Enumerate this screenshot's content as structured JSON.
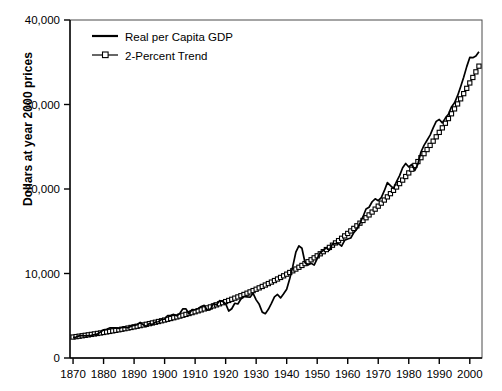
{
  "chart_data": {
    "type": "line",
    "title": "",
    "xlabel": "",
    "ylabel": "Dollars at year 2000 prices",
    "xlim": [
      1869,
      2004
    ],
    "ylim": [
      0,
      40000
    ],
    "grid": false,
    "legend_position": "top-left-inside",
    "xticks": [
      1870,
      1880,
      1890,
      1900,
      1910,
      1920,
      1930,
      1940,
      1950,
      1960,
      1970,
      1980,
      1990,
      2000
    ],
    "xtick_labels": [
      "1870",
      "1880",
      "1890",
      "1900",
      "1910",
      "1920",
      "1930",
      "1940",
      "1950",
      "1960",
      "1970",
      "1980",
      "1990",
      "2000"
    ],
    "yticks": [
      0,
      10000,
      20000,
      30000,
      40000
    ],
    "ytick_labels": [
      "0",
      "10,000",
      "20,000",
      "30,000",
      "40,000"
    ],
    "series": [
      {
        "name": "Real per Capita GDP",
        "marker": "none",
        "color": "#000000",
        "x": [
          1870,
          1871,
          1872,
          1873,
          1874,
          1875,
          1876,
          1877,
          1878,
          1879,
          1880,
          1881,
          1882,
          1883,
          1884,
          1885,
          1886,
          1887,
          1888,
          1889,
          1890,
          1891,
          1892,
          1893,
          1894,
          1895,
          1896,
          1897,
          1898,
          1899,
          1900,
          1901,
          1902,
          1903,
          1904,
          1905,
          1906,
          1907,
          1908,
          1909,
          1910,
          1911,
          1912,
          1913,
          1914,
          1915,
          1916,
          1917,
          1918,
          1919,
          1920,
          1921,
          1922,
          1923,
          1924,
          1925,
          1926,
          1927,
          1928,
          1929,
          1930,
          1931,
          1932,
          1933,
          1934,
          1935,
          1936,
          1937,
          1938,
          1939,
          1940,
          1941,
          1942,
          1943,
          1944,
          1945,
          1946,
          1947,
          1948,
          1949,
          1950,
          1951,
          1952,
          1953,
          1954,
          1955,
          1956,
          1957,
          1958,
          1959,
          1960,
          1961,
          1962,
          1963,
          1964,
          1965,
          1966,
          1967,
          1968,
          1969,
          1970,
          1971,
          1972,
          1973,
          1974,
          1975,
          1976,
          1977,
          1978,
          1979,
          1980,
          1981,
          1982,
          1983,
          1984,
          1985,
          1986,
          1987,
          1988,
          1989,
          1990,
          1991,
          1992,
          1993,
          1994,
          1995,
          1996,
          1997,
          1998,
          1999,
          2000,
          2001,
          2002,
          2003
        ],
        "values": [
          2445,
          2480,
          2620,
          2660,
          2610,
          2650,
          2680,
          2760,
          2830,
          3080,
          3340,
          3390,
          3560,
          3580,
          3560,
          3490,
          3610,
          3640,
          3570,
          3760,
          3870,
          3940,
          4220,
          3930,
          3720,
          4090,
          3950,
          4260,
          4290,
          4580,
          4610,
          5030,
          5050,
          5160,
          4990,
          5290,
          5830,
          5820,
          5210,
          5730,
          5700,
          5850,
          6090,
          6230,
          5650,
          5710,
          6450,
          6280,
          6790,
          6690,
          6430,
          5560,
          5830,
          6480,
          6390,
          6980,
          7280,
          7240,
          7190,
          7660,
          6880,
          6350,
          5430,
          5250,
          5760,
          6470,
          7230,
          7520,
          7110,
          7600,
          8140,
          9380,
          10840,
          12520,
          13270,
          12990,
          11300,
          11000,
          11200,
          10990,
          11750,
          12460,
          12740,
          13070,
          12770,
          13520,
          13550,
          13530,
          13240,
          13930,
          14090,
          14200,
          14840,
          15270,
          15920,
          16720,
          17630,
          17840,
          18490,
          18840,
          18620,
          18970,
          19800,
          20750,
          20390,
          20070,
          20880,
          21580,
          22520,
          23020,
          22610,
          22920,
          22200,
          22950,
          24380,
          25160,
          25770,
          26380,
          27230,
          28000,
          28230,
          27820,
          28390,
          28850,
          29710,
          30200,
          31040,
          32100,
          33220,
          34480,
          35570,
          35540,
          35740,
          36250
        ]
      },
      {
        "name": "2-Percent Trend",
        "marker": "square-open",
        "color": "#000000",
        "x": [
          1870,
          1871,
          1872,
          1873,
          1874,
          1875,
          1876,
          1877,
          1878,
          1879,
          1880,
          1881,
          1882,
          1883,
          1884,
          1885,
          1886,
          1887,
          1888,
          1889,
          1890,
          1891,
          1892,
          1893,
          1894,
          1895,
          1896,
          1897,
          1898,
          1899,
          1900,
          1901,
          1902,
          1903,
          1904,
          1905,
          1906,
          1907,
          1908,
          1909,
          1910,
          1911,
          1912,
          1913,
          1914,
          1915,
          1916,
          1917,
          1918,
          1919,
          1920,
          1921,
          1922,
          1923,
          1924,
          1925,
          1926,
          1927,
          1928,
          1929,
          1930,
          1931,
          1932,
          1933,
          1934,
          1935,
          1936,
          1937,
          1938,
          1939,
          1940,
          1941,
          1942,
          1943,
          1944,
          1945,
          1946,
          1947,
          1948,
          1949,
          1950,
          1951,
          1952,
          1953,
          1954,
          1955,
          1956,
          1957,
          1958,
          1959,
          1960,
          1961,
          1962,
          1963,
          1964,
          1965,
          1966,
          1967,
          1968,
          1969,
          1970,
          1971,
          1972,
          1973,
          1974,
          1975,
          1976,
          1977,
          1978,
          1979,
          1980,
          1981,
          1982,
          1983,
          1984,
          1985,
          1986,
          1987,
          1988,
          1989,
          1990,
          1991,
          1992,
          1993,
          1994,
          1995,
          1996,
          1997,
          1998,
          1999,
          2000,
          2001,
          2002,
          2003
        ],
        "values": [
          2480,
          2530,
          2580,
          2632,
          2685,
          2738,
          2793,
          2849,
          2906,
          2964,
          3023,
          3084,
          3145,
          3208,
          3272,
          3338,
          3405,
          3473,
          3542,
          3613,
          3685,
          3759,
          3834,
          3911,
          3989,
          4069,
          4150,
          4233,
          4318,
          4404,
          4492,
          4582,
          4674,
          4767,
          4863,
          4960,
          5059,
          5160,
          5264,
          5369,
          5476,
          5586,
          5698,
          5811,
          5928,
          6046,
          6167,
          6291,
          6416,
          6545,
          6676,
          6809,
          6945,
          7084,
          7226,
          7370,
          7518,
          7668,
          7822,
          7978,
          8138,
          8300,
          8466,
          8636,
          8808,
          8985,
          9164,
          9348,
          9535,
          9725,
          9920,
          10118,
          10321,
          10527,
          10738,
          10953,
          11172,
          11395,
          11623,
          11855,
          12092,
          12334,
          12581,
          12833,
          13089,
          13351,
          13618,
          13890,
          14168,
          14452,
          14741,
          15036,
          15336,
          15643,
          15956,
          16275,
          16600,
          16932,
          17271,
          17616,
          17969,
          18328,
          18695,
          19069,
          19450,
          19839,
          20236,
          20640,
          21053,
          21474,
          21904,
          22342,
          22789,
          23245,
          23709,
          24184,
          24667,
          25161,
          25664,
          26177,
          26701,
          27235,
          27780,
          28335,
          28902,
          29480,
          30069,
          30671,
          31284,
          31910,
          32548,
          33199,
          33863,
          34540
        ]
      }
    ],
    "annotations": []
  },
  "legend": {
    "entries": [
      {
        "label": "Real per Capita GDP",
        "marker": "line"
      },
      {
        "label": "2-Percent Trend",
        "marker": "line-square"
      }
    ]
  }
}
